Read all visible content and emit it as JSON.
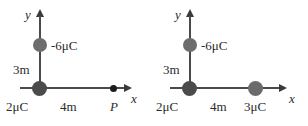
{
  "figure": {
    "type": "physics-diagram",
    "background_color": "#ffffff",
    "stroke_color": "#4a4a4a",
    "charge_fill_gray": "#6d6d6d",
    "charge_fill_dark": "#4b4b4b",
    "point_color": "#1c1c1c"
  },
  "diagrams": [
    {
      "id": "left",
      "axis_y_label": "y",
      "axis_x_label": "x",
      "charges": [
        {
          "label": "-6μC",
          "position": "y-axis",
          "distance_from_origin": "3m"
        },
        {
          "label": "2μC",
          "position": "origin",
          "distance_from_origin": "0"
        }
      ],
      "distance_labels": [
        {
          "text": "3m",
          "axis": "y"
        },
        {
          "text": "4m",
          "axis": "x"
        }
      ],
      "field_point": {
        "label": "P",
        "position": "x-axis",
        "distance_from_origin": "4m"
      }
    },
    {
      "id": "right",
      "axis_y_label": "y",
      "axis_x_label": "x",
      "charges": [
        {
          "label": "-6μC",
          "position": "y-axis",
          "distance_from_origin": "3m"
        },
        {
          "label": "2μC",
          "position": "origin",
          "distance_from_origin": "0"
        },
        {
          "label": "3μC",
          "position": "x-axis",
          "distance_from_origin": "4m"
        }
      ],
      "distance_labels": [
        {
          "text": "3m",
          "axis": "y"
        },
        {
          "text": "4m",
          "axis": "x"
        }
      ],
      "field_point": null
    }
  ]
}
